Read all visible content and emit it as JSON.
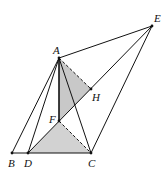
{
  "diagram": {
    "type": "geometry-figure",
    "colors": {
      "line": "#111111",
      "shade": "#c8c8c8",
      "background": "#ffffff"
    },
    "points": {
      "A": {
        "label": "A",
        "x": 59,
        "y": 58
      },
      "B": {
        "label": "B",
        "x": 12,
        "y": 153
      },
      "C": {
        "label": "C",
        "x": 91,
        "y": 153
      },
      "D": {
        "label": "D",
        "x": 28,
        "y": 153
      },
      "E": {
        "label": "E",
        "x": 152,
        "y": 26
      },
      "F": {
        "label": "F",
        "x": 59,
        "y": 121
      },
      "H": {
        "label": "H",
        "x": 91,
        "y": 89
      }
    },
    "solid_segments": [
      "AB",
      "AD",
      "AC",
      "AE",
      "AF",
      "BC",
      "DE",
      "CE"
    ],
    "dashed_segments": [
      "AH",
      "FC"
    ],
    "shaded_triangles": [
      "AFH",
      "DFC"
    ]
  }
}
